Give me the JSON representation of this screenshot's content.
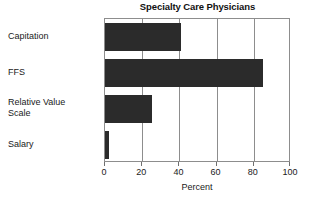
{
  "chart_data": {
    "type": "bar",
    "orientation": "horizontal",
    "title": "Specialty Care Physicians",
    "xlabel": "Percent",
    "ylabel": "",
    "categories": [
      "Capitation",
      "FFS",
      "Relative Value Scale",
      "Salary"
    ],
    "values": [
      41,
      85,
      25,
      2
    ],
    "xlim": [
      0,
      100
    ],
    "xticks": [
      0,
      20,
      40,
      60,
      80,
      100
    ],
    "xtick_labels": [
      "0",
      "20",
      "40",
      "60",
      "80",
      "100"
    ],
    "grid": true,
    "grid_axis": "x",
    "legend": false,
    "bar_color": "#2b2b2b",
    "frame_color": "#8d8d8d",
    "background": "#ffffff"
  },
  "category_label_lines": [
    [
      "Capitation"
    ],
    [
      "FFS"
    ],
    [
      "Relative Value",
      "Scale"
    ],
    [
      "Salary"
    ]
  ]
}
